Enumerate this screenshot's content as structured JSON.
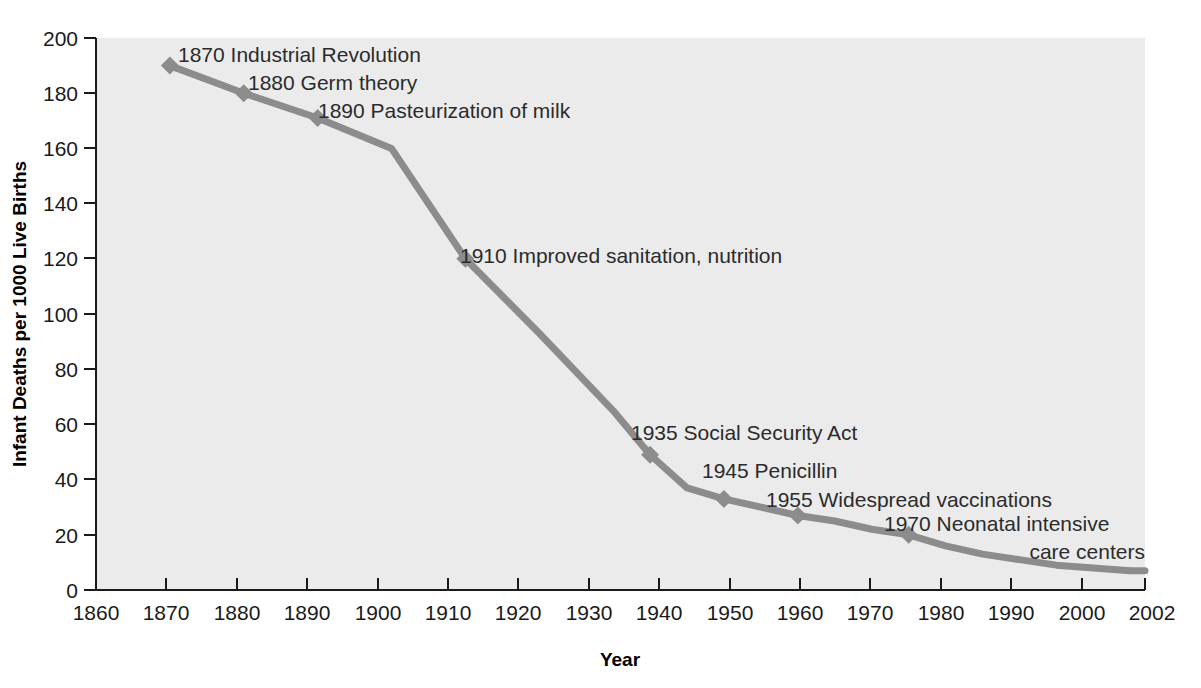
{
  "chart_data": {
    "type": "line",
    "title": "",
    "xlabel": "Year",
    "ylabel": "Infant Deaths per 1000 Live Births",
    "xlim": [
      1860,
      2002
    ],
    "ylim": [
      0,
      200
    ],
    "grid": false,
    "legend": "none",
    "line_color": "#8c8c8c",
    "plot_background": "#ebebeb",
    "axis_color": "#1a1a1a",
    "xticks": [
      1860,
      1870,
      1880,
      1890,
      1900,
      1910,
      1920,
      1930,
      1940,
      1950,
      1960,
      1970,
      1980,
      1990,
      2000,
      2002
    ],
    "xtick_labels": [
      "1860",
      "1870",
      "1880",
      "1890",
      "1900",
      "1910",
      "1920",
      "1930",
      "1940",
      "1950",
      "1960",
      "1970",
      "1980",
      "1990",
      "2000",
      "2002"
    ],
    "yticks": [
      0,
      20,
      40,
      60,
      80,
      100,
      120,
      140,
      160,
      180,
      200
    ],
    "ytick_labels": [
      "0",
      "20",
      "40",
      "60",
      "80",
      "100",
      "120",
      "140",
      "160",
      "180",
      "200"
    ],
    "x": [
      1870,
      1880,
      1890,
      1900,
      1910,
      1920,
      1930,
      1935,
      1940,
      1945,
      1950,
      1955,
      1960,
      1965,
      1970,
      1975,
      1980,
      1985,
      1990,
      1995,
      2000,
      2002
    ],
    "y": [
      190,
      180,
      171,
      160,
      120,
      93,
      65,
      49,
      37,
      33,
      30,
      27,
      25,
      22,
      20,
      16,
      13,
      11,
      9,
      8,
      7,
      7
    ],
    "markers": [
      {
        "x": 1870,
        "y": 190
      },
      {
        "x": 1880,
        "y": 180
      },
      {
        "x": 1890,
        "y": 171
      },
      {
        "x": 1910,
        "y": 120
      },
      {
        "x": 1935,
        "y": 49
      },
      {
        "x": 1945,
        "y": 33
      },
      {
        "x": 1955,
        "y": 27
      },
      {
        "x": 1970,
        "y": 20
      }
    ],
    "annotations": [
      {
        "id": "a1870",
        "text": "1870 Industrial Revolution",
        "x": 1872,
        "y": 192
      },
      {
        "id": "a1880",
        "text": "1880 Germ theory",
        "x": 1883,
        "y": 182
      },
      {
        "id": "a1890",
        "text": "1890 Pasteurization of milk",
        "x": 1893,
        "y": 172
      },
      {
        "id": "a1910",
        "text": "1910 Improved sanitation, nutrition",
        "x": 1913,
        "y": 121
      },
      {
        "id": "a1935",
        "text": "1935 Social Security Act",
        "x": 1938,
        "y": 52
      },
      {
        "id": "a1945",
        "text": "1945 Penicillin",
        "x": 1948,
        "y": 39
      },
      {
        "id": "a1955",
        "text": "1955 Widespread vaccinations",
        "x": 1958,
        "y": 30
      },
      {
        "id": "a1970a",
        "text": "1970 Neonatal intensive",
        "x": 1973,
        "y": 23
      },
      {
        "id": "a1970b",
        "text": "care centers",
        "x": 1995,
        "y": 16
      }
    ]
  },
  "labels": {
    "y_axis_title": "Infant Deaths per 1000 Live Births",
    "x_axis_title": "Year",
    "ytick_200": "200",
    "ytick_180": "180",
    "ytick_160": "160",
    "ytick_140": "140",
    "ytick_120": "120",
    "ytick_100": "100",
    "ytick_80": "80",
    "ytick_60": "60",
    "ytick_40": "40",
    "ytick_20": "20",
    "ytick_0": "0",
    "xtick_1860": "1860",
    "xtick_1870": "1870",
    "xtick_1880": "1880",
    "xtick_1890": "1890",
    "xtick_1900": "1900",
    "xtick_1910": "1910",
    "xtick_1920": "1920",
    "xtick_1930": "1930",
    "xtick_1940": "1940",
    "xtick_1950": "1950",
    "xtick_1960": "1960",
    "xtick_1970": "1970",
    "xtick_1980": "1980",
    "xtick_1990": "1990",
    "xtick_2000": "2000",
    "xtick_2002": "2002"
  },
  "annotation_text": {
    "industrial_revolution": "1870 Industrial Revolution",
    "germ_theory": "1880 Germ theory",
    "pasteurization": "1890 Pasteurization of milk",
    "sanitation": "1910 Improved sanitation, nutrition",
    "social_security": "1935 Social Security Act",
    "penicillin": "1945 Penicillin",
    "vaccinations": "1955 Widespread vaccinations",
    "neonatal_line1": "1970 Neonatal intensive",
    "neonatal_line2": "care centers"
  }
}
